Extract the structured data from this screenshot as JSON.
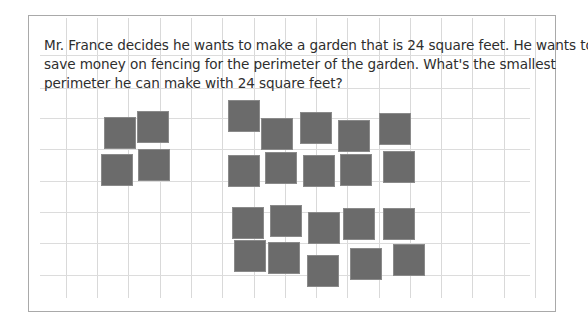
{
  "question": {
    "lines": [
      "Mr. France decides he wants to make a garden that is 24 square feet. He wants to",
      "save money on fencing for the perimeter of the garden. What's the smallest",
      "perimeter he can make with 24 square feet?"
    ]
  },
  "grid": {
    "vertical_lines_x": [
      66,
      97,
      128,
      160,
      191,
      222,
      254,
      285,
      316,
      347,
      379,
      410,
      441,
      472,
      504,
      535
    ],
    "horizontal_lines_y": [
      55,
      88,
      118,
      149,
      181,
      212,
      243,
      275
    ]
  },
  "tiles": {
    "count": 24,
    "color": "#6b6b6b",
    "groups": [
      {
        "name": "group-2x2",
        "positions": [
          [
            104,
            117
          ],
          [
            137,
            111
          ],
          [
            101,
            154
          ],
          [
            138,
            149
          ]
        ]
      },
      {
        "name": "group-top-middle",
        "positions": [
          [
            228,
            100
          ],
          [
            261,
            118
          ],
          [
            300,
            112
          ],
          [
            338,
            120
          ],
          [
            379,
            113
          ],
          [
            228,
            155
          ],
          [
            265,
            152
          ],
          [
            303,
            155
          ],
          [
            340,
            154
          ],
          [
            383,
            151
          ]
        ]
      },
      {
        "name": "group-bottom-middle",
        "positions": [
          [
            232,
            207
          ],
          [
            270,
            205
          ],
          [
            308,
            212
          ],
          [
            343,
            208
          ],
          [
            383,
            208
          ],
          [
            234,
            240
          ],
          [
            268,
            242
          ],
          [
            307,
            255
          ],
          [
            350,
            248
          ],
          [
            393,
            244
          ]
        ]
      }
    ]
  }
}
